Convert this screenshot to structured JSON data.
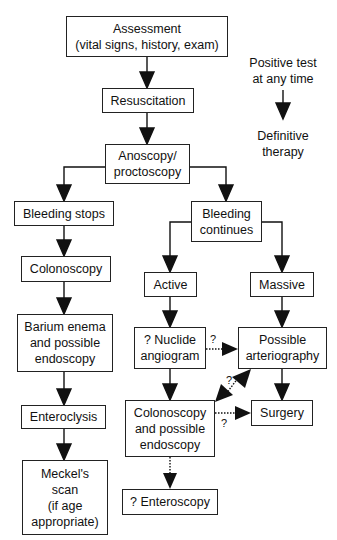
{
  "nodes": {
    "assessment": "Assessment\n(vital signs, history, exam)",
    "resuscitation": "Resuscitation",
    "anoscopy": "Anoscopy/\nproctoscopy",
    "bleeding_stops": "Bleeding stops",
    "bleeding_continues": "Bleeding\ncontinues",
    "colonoscopy_left": "Colonoscopy",
    "active": "Active",
    "massive": "Massive",
    "barium_enema": "Barium enema\nand possible\nendoscopy",
    "nuclide_angiogram": "? Nuclide\nangiogram",
    "possible_arteriography": "Possible\narteriography",
    "enteroclysis": "Enteroclysis",
    "colonoscopy_endoscopy": "Colonoscopy\nand possible\nendoscopy",
    "surgery": "Surgery",
    "meckels_scan": "Meckel's\nscan\n(if age\nappropriate)",
    "enteroscopy": "? Enteroscopy"
  },
  "legend": {
    "top": "Positive test\nat any time",
    "bottom": "Definitive\ntherapy"
  },
  "edge_labels": {
    "nuclide_to_arteriography": "?",
    "colonoscopy_to_arteriography": "?",
    "colonoscopy_to_surgery": "?"
  }
}
